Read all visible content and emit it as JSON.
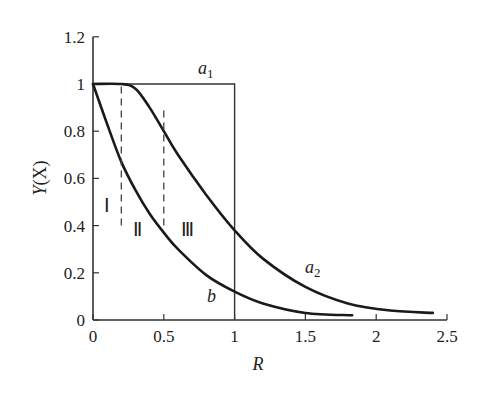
{
  "chart_data": {
    "type": "line",
    "title": "",
    "xlabel": "R",
    "ylabel": "Y(X)",
    "xlim": [
      0,
      2.5
    ],
    "ylim": [
      0,
      1.2
    ],
    "xticks": [
      "0",
      "0.5",
      "1",
      "1.5",
      "2",
      "2.5"
    ],
    "yticks": [
      "0",
      "0.2",
      "0.4",
      "0.6",
      "0.8",
      "1",
      "1.2"
    ],
    "grid": false,
    "series": [
      {
        "name": "a1",
        "style": "step",
        "x": [
          0,
          1,
          1
        ],
        "y": [
          1,
          1,
          0
        ]
      },
      {
        "name": "a2",
        "x": [
          0,
          0.2,
          0.3,
          0.4,
          0.5,
          0.6,
          0.8,
          1.0,
          1.2,
          1.5,
          1.8,
          2.1,
          2.4
        ],
        "y": [
          1.0,
          1.0,
          0.98,
          0.9,
          0.8,
          0.7,
          0.53,
          0.38,
          0.26,
          0.14,
          0.07,
          0.04,
          0.03
        ]
      },
      {
        "name": "b",
        "x": [
          0,
          0.1,
          0.2,
          0.3,
          0.4,
          0.5,
          0.6,
          0.8,
          1.0,
          1.2,
          1.5,
          1.83
        ],
        "y": [
          1.0,
          0.83,
          0.67,
          0.55,
          0.45,
          0.37,
          0.3,
          0.19,
          0.12,
          0.07,
          0.03,
          0.02
        ]
      }
    ],
    "annotations": [
      {
        "text": "a1",
        "x": 0.95,
        "y": 1.07
      },
      {
        "text": "a2",
        "x": 1.55,
        "y": 0.18
      },
      {
        "text": "b",
        "x": 0.82,
        "y": 0.1
      },
      {
        "text": "I",
        "x": 0.11,
        "y": 0.48
      },
      {
        "text": "II",
        "x": 0.34,
        "y": 0.38
      },
      {
        "text": "III",
        "x": 0.72,
        "y": 0.38
      }
    ],
    "dashed_lines": [
      {
        "x": 0.2,
        "y_from": 0.4,
        "y_to": 1.0
      },
      {
        "x": 0.5,
        "y_from": 0.4,
        "y_to": 0.9
      }
    ],
    "legend": "none"
  },
  "labels": {
    "ylabel_main": "Y",
    "ylabel_arg": "(X)",
    "xlabel": "R",
    "a1_base": "a",
    "a1_sub": "1",
    "a2_base": "a",
    "a2_sub": "2",
    "b": "b",
    "roman1": "Ⅰ",
    "roman2": "Ⅱ",
    "roman3": "Ⅲ"
  }
}
